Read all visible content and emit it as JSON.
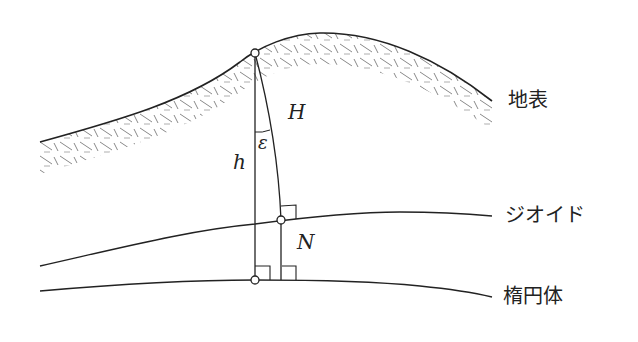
{
  "diagram": {
    "title": "",
    "surfaces": {
      "ground": {
        "label": "地表"
      },
      "geoid": {
        "label": "ジオイド"
      },
      "ellipsoid": {
        "label": "楕円体"
      }
    },
    "symbols": {
      "ellipsoidal_height": "h",
      "orthometric_height": "H",
      "geoid_height": "N",
      "deflection": "ε"
    },
    "colors": {
      "line": "#222222",
      "hatch": "#888888",
      "background": "#ffffff"
    }
  }
}
